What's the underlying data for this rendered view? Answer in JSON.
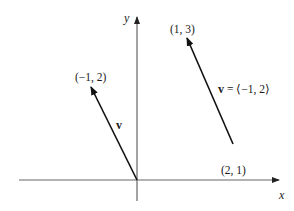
{
  "diagram": {
    "type": "vector-plane",
    "axes": {
      "x_label": "x",
      "y_label": "y",
      "color": "#555555"
    },
    "vectors": [
      {
        "name": "v",
        "label": "v",
        "from": [
          0,
          0
        ],
        "to": [
          -1,
          2
        ],
        "tip_label": "(−1, 2)",
        "color": "#111111"
      },
      {
        "name": "v-translated",
        "label": "v = ⟨−1, 2⟩",
        "from": [
          2,
          1
        ],
        "to": [
          1,
          3
        ],
        "tail_label": "(2, 1)",
        "tip_label": "(1, 3)",
        "color": "#111111"
      }
    ]
  },
  "labels": {
    "x_axis": "x",
    "y_axis": "y",
    "v_tip": "(−1, 2)",
    "v_name": "v",
    "translated_tip": "(1, 3)",
    "translated_name": "v = ⟨−1, 2⟩",
    "translated_tail": "(2, 1)"
  }
}
